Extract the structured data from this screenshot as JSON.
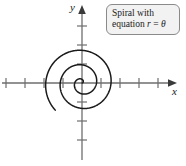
{
  "figure": {
    "background_color": "#ffffff",
    "axis_color": "#6e6e6e",
    "curve_color": "#1a1a1a",
    "callout_fill": "#f2f2f2",
    "callout_border": "#8a8a8a",
    "origin": {
      "x": 82,
      "y": 83
    }
  },
  "axes": {
    "y_label": "y",
    "x_label": "x",
    "x_ticks_negative": 5,
    "x_ticks_positive": 3,
    "y_ticks_positive": 3,
    "y_ticks_negative": 3,
    "tick_spacing_px": 19
  },
  "callout": {
    "line1": "Spiral with",
    "line2_prefix": "equation ",
    "line2_var_r": "r",
    "line2_equals": " = ",
    "line2_var_theta": "θ"
  },
  "chart_data": {
    "type": "line",
    "title": "Spiral with equation r = θ",
    "xlabel": "x",
    "ylabel": "y",
    "grid": false,
    "legend_position": "top-right",
    "polar_equation": "r = theta",
    "theta_start": 0,
    "theta_end": 16.5,
    "turns": 2.62,
    "direction": "counterclockwise",
    "xlim": [
      -5.2,
      3.4
    ],
    "ylim": [
      -4.3,
      2.5
    ],
    "annotations": [
      "Spiral with equation r = θ"
    ],
    "x": [
      0,
      0.5,
      1,
      1.5,
      2,
      2.5,
      3,
      3.5,
      4,
      4.5,
      5,
      5.5,
      6,
      6.5,
      7,
      7.5,
      8,
      8.5,
      9,
      9.5,
      10,
      10.5,
      11,
      11.5,
      12,
      12.5,
      13,
      13.5,
      14,
      14.5,
      15,
      15.5,
      16,
      16.5
    ],
    "values": [
      0,
      0.44,
      0.54,
      0.11,
      -0.83,
      -2.0,
      -2.97,
      -3.28,
      -2.61,
      -0.95,
      1.42,
      3.9,
      5.76,
      6.37,
      5.27,
      2.62,
      -1.16,
      -5.14,
      -8.2,
      -9.36,
      -8.16,
      -4.68,
      0.44,
      6.11,
      10.13,
      12.5,
      11.95,
      8.52,
      2.83,
      -4.06,
      -10.1,
      -14.3,
      -15.4,
      -13.4
    ]
  }
}
